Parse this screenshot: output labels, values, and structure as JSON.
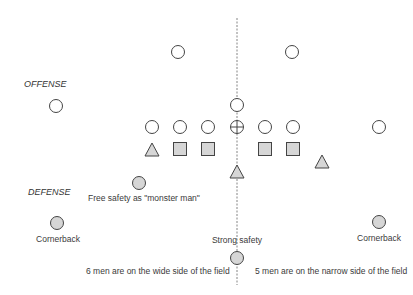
{
  "diagram": {
    "type": "football-formation",
    "labels": {
      "offense": "OFFENSE",
      "defense": "DEFENSE",
      "free_safety": "Free safety as \"monster man\"",
      "cornerback_left": "Cornerback",
      "cornerback_right": "Cornerback",
      "strong_safety": "Strong safety",
      "wide_side_note": "6 men are on the wide side of the field",
      "narrow_side_note": "5 men are on the narrow side of the field"
    },
    "colors": {
      "stroke": "#444444",
      "defense_fill": "#d6d6d6",
      "offense_fill": "#ffffff",
      "midline": "#666666"
    },
    "midline": {
      "x": 237,
      "y1": 18,
      "y2": 285
    },
    "offense": [
      {
        "shape": "circle",
        "x": 178,
        "y": 52
      },
      {
        "shape": "circle",
        "x": 292,
        "y": 52
      },
      {
        "shape": "circle",
        "x": 56,
        "y": 106
      },
      {
        "shape": "circle",
        "x": 237,
        "y": 105
      },
      {
        "shape": "circle",
        "x": 152,
        "y": 127
      },
      {
        "shape": "circle",
        "x": 180,
        "y": 127
      },
      {
        "shape": "circle",
        "x": 208,
        "y": 127
      },
      {
        "shape": "crosshair-circle",
        "x": 237,
        "y": 127
      },
      {
        "shape": "circle",
        "x": 265,
        "y": 127
      },
      {
        "shape": "circle",
        "x": 293,
        "y": 127
      },
      {
        "shape": "circle",
        "x": 379,
        "y": 127
      }
    ],
    "defense": [
      {
        "shape": "triangle",
        "x": 152,
        "y": 150
      },
      {
        "shape": "square",
        "x": 180,
        "y": 149
      },
      {
        "shape": "square",
        "x": 208,
        "y": 149
      },
      {
        "shape": "square",
        "x": 265,
        "y": 149
      },
      {
        "shape": "square",
        "x": 293,
        "y": 149
      },
      {
        "shape": "triangle",
        "x": 322,
        "y": 162
      },
      {
        "shape": "triangle",
        "x": 237,
        "y": 172
      },
      {
        "shape": "circle",
        "x": 139,
        "y": 183
      },
      {
        "shape": "circle",
        "x": 57,
        "y": 223
      },
      {
        "shape": "circle",
        "x": 379,
        "y": 222
      },
      {
        "shape": "circle",
        "x": 237,
        "y": 258
      }
    ]
  }
}
